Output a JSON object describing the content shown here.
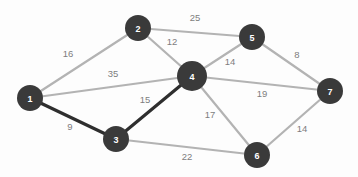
{
  "diagram": {
    "type": "node-link-graph",
    "canvas": {
      "width": 358,
      "height": 177
    },
    "colors": {
      "background": "#fdfdfd",
      "node_fill": "#3a3a3a",
      "node_label": "#ffffff",
      "edge": "#b3b3b3",
      "edge_highlight": "#2e2e2e",
      "weight_label": "#7d7d7d"
    },
    "nodes": [
      {
        "id": "1",
        "label": "1",
        "x": 30,
        "y": 98,
        "r": 13
      },
      {
        "id": "2",
        "label": "2",
        "x": 138,
        "y": 28,
        "r": 13
      },
      {
        "id": "3",
        "label": "3",
        "x": 116,
        "y": 139,
        "r": 13
      },
      {
        "id": "4",
        "label": "4",
        "x": 192,
        "y": 76,
        "r": 15
      },
      {
        "id": "5",
        "label": "5",
        "x": 252,
        "y": 37,
        "r": 13
      },
      {
        "id": "6",
        "label": "6",
        "x": 257,
        "y": 155,
        "r": 13
      },
      {
        "id": "7",
        "label": "7",
        "x": 330,
        "y": 91,
        "r": 13
      }
    ],
    "edges": [
      {
        "id": "e-1-2",
        "from": "1",
        "to": "2",
        "weight": "16",
        "label_x": 68,
        "label_y": 54,
        "highlight": false
      },
      {
        "id": "e-1-4",
        "from": "1",
        "to": "4",
        "weight": "35",
        "label_x": 113,
        "label_y": 74,
        "highlight": false
      },
      {
        "id": "e-1-3",
        "from": "1",
        "to": "3",
        "weight": "9",
        "label_x": 70,
        "label_y": 127,
        "highlight": true
      },
      {
        "id": "e-2-5",
        "from": "2",
        "to": "5",
        "weight": "25",
        "label_x": 195,
        "label_y": 18,
        "highlight": false
      },
      {
        "id": "e-2-4",
        "from": "2",
        "to": "4",
        "weight": "12",
        "label_x": 172,
        "label_y": 42,
        "highlight": false
      },
      {
        "id": "e-3-4",
        "from": "3",
        "to": "4",
        "weight": "15",
        "label_x": 145,
        "label_y": 100,
        "highlight": true
      },
      {
        "id": "e-3-6",
        "from": "3",
        "to": "6",
        "weight": "22",
        "label_x": 187,
        "label_y": 157,
        "highlight": false
      },
      {
        "id": "e-4-5",
        "from": "4",
        "to": "5",
        "weight": "14",
        "label_x": 230,
        "label_y": 62,
        "highlight": false
      },
      {
        "id": "e-4-7",
        "from": "4",
        "to": "7",
        "weight": "19",
        "label_x": 262,
        "label_y": 94,
        "highlight": false
      },
      {
        "id": "e-4-6",
        "from": "4",
        "to": "6",
        "weight": "17",
        "label_x": 210,
        "label_y": 115,
        "highlight": false
      },
      {
        "id": "e-5-7",
        "from": "5",
        "to": "7",
        "weight": "8",
        "label_x": 297,
        "label_y": 55,
        "highlight": false
      },
      {
        "id": "e-6-7",
        "from": "6",
        "to": "7",
        "weight": "14",
        "label_x": 302,
        "label_y": 129,
        "highlight": false
      }
    ]
  }
}
